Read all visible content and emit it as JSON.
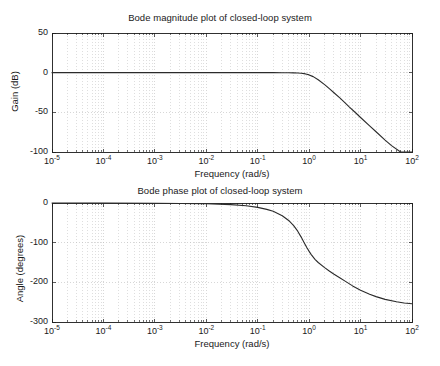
{
  "figure": {
    "background": "#ffffff",
    "axis_color": "#1a1a1a",
    "grid_color": "#bdbdbd",
    "curve_color": "#2b2b2b"
  },
  "chart_data": [
    {
      "type": "line",
      "id": "bode-magnitude",
      "title": "Bode magnitude plot of closed-loop system",
      "xlabel": "Frequency (rad/s)",
      "ylabel": "Gain (dB)",
      "xscale": "log",
      "xlim": [
        1e-05,
        100
      ],
      "ylim": [
        -100,
        50
      ],
      "xticks": [
        1e-05,
        0.0001,
        0.001,
        0.01,
        0.1,
        1,
        10,
        100
      ],
      "xtick_labels": [
        "10^-5",
        "10^-4",
        "10^-3",
        "10^-2",
        "10^-1",
        "10^0",
        "10^1",
        "10^2"
      ],
      "xtick_mantissa": [
        "10",
        "10",
        "10",
        "10",
        "10",
        "10",
        "10",
        "10"
      ],
      "xtick_exponent": [
        "-5",
        "-4",
        "-3",
        "-2",
        "-1",
        "0",
        "1",
        "2"
      ],
      "yticks": [
        50,
        0,
        -50,
        -100
      ],
      "ytick_labels": [
        "50",
        "0",
        "-50",
        "-100"
      ],
      "grid": true,
      "minor_grid": true,
      "legend": null,
      "series": [
        {
          "name": "closed-loop magnitude",
          "x": [
            1e-05,
            0.0001,
            0.001,
            0.01,
            0.05,
            0.1,
            0.2,
            0.3,
            0.4,
            0.5,
            0.6,
            0.7,
            0.8,
            0.9,
            1.0,
            1.2,
            1.5,
            2.0,
            2.5,
            3.0,
            4.0,
            5.0,
            6.0,
            8.0,
            10.0,
            15.0,
            20.0,
            30.0,
            40.0,
            60.0,
            80.0,
            100.0
          ],
          "y": [
            0.0,
            0.0,
            0.0,
            0.0,
            0.0,
            0.0,
            0.0,
            -0.05,
            -0.1,
            -0.2,
            -0.4,
            -0.7,
            -1.2,
            -1.9,
            -2.8,
            -5.0,
            -9.0,
            -15.0,
            -20.5,
            -25.0,
            -32.0,
            -38.0,
            -43.0,
            -50.5,
            -56.5,
            -67.0,
            -74.5,
            -85.0,
            -92.0,
            -101.0,
            -107.0,
            -112.0
          ]
        }
      ]
    },
    {
      "type": "line",
      "id": "bode-phase",
      "title": "Bode phase plot of closed-loop system",
      "xlabel": "Frequency (rad/s)",
      "ylabel": "Angle (degrees)",
      "xscale": "log",
      "xlim": [
        1e-05,
        100
      ],
      "ylim": [
        -300,
        0
      ],
      "xticks": [
        1e-05,
        0.0001,
        0.001,
        0.01,
        0.1,
        1,
        10,
        100
      ],
      "xtick_labels": [
        "10^-5",
        "10^-4",
        "10^-3",
        "10^-2",
        "10^-1",
        "10^0",
        "10^1",
        "10^2"
      ],
      "xtick_mantissa": [
        "10",
        "10",
        "10",
        "10",
        "10",
        "10",
        "10",
        "10"
      ],
      "xtick_exponent": [
        "-5",
        "-4",
        "-3",
        "-2",
        "-1",
        "0",
        "1",
        "2"
      ],
      "yticks": [
        0,
        -100,
        -200,
        -300
      ],
      "ytick_labels": [
        "0",
        "-100",
        "-200",
        "-300"
      ],
      "grid": true,
      "minor_grid": true,
      "legend": null,
      "series": [
        {
          "name": "closed-loop phase",
          "x": [
            1e-05,
            0.0001,
            0.001,
            0.01,
            0.03,
            0.06,
            0.1,
            0.15,
            0.2,
            0.3,
            0.4,
            0.5,
            0.6,
            0.7,
            0.8,
            0.9,
            1.0,
            1.1,
            1.3,
            1.5,
            2.0,
            2.5,
            3.0,
            4.0,
            5.0,
            7.0,
            10.0,
            15.0,
            20.0,
            30.0,
            50.0,
            70.0,
            100.0
          ],
          "y": [
            0.0,
            -0.2,
            -0.6,
            -2.0,
            -4.0,
            -7.0,
            -11.0,
            -16.0,
            -21.0,
            -32.0,
            -44.0,
            -57.0,
            -71.0,
            -86.0,
            -100.0,
            -112.0,
            -122.0,
            -130.0,
            -142.0,
            -150.0,
            -163.0,
            -172.0,
            -179.0,
            -189.0,
            -197.0,
            -209.0,
            -220.0,
            -230.0,
            -236.0,
            -243.0,
            -249.0,
            -252.0,
            -254.0
          ]
        }
      ]
    }
  ],
  "magnitude": {
    "title": "Bode magnitude plot of closed-loop system",
    "ylabel": "Gain (dB)",
    "xlabel": "Frequency (rad/s)"
  },
  "phase": {
    "title": "Bode phase plot of closed-loop system",
    "ylabel": "Angle (degrees)",
    "xlabel": "Frequency (rad/s)"
  }
}
